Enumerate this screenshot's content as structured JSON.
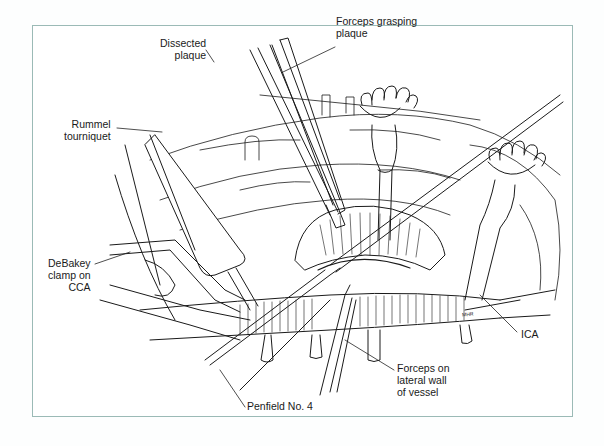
{
  "figure": {
    "border_color": "#9bbab6",
    "line_color": "#1a1a1a"
  },
  "labels": {
    "dissected_plaque": [
      "Dissected",
      "plaque"
    ],
    "forceps_grasping_plaque": [
      "Forceps grasping",
      "plaque"
    ],
    "rummel_tourniquet": [
      "Rummel",
      "tourniquet"
    ],
    "debakey_clamp": [
      "DeBakey",
      "clamp on",
      "CCA"
    ],
    "ica": [
      "ICA"
    ],
    "forceps_lateral_wall": [
      "Forceps on",
      "lateral wall",
      "of vessel"
    ],
    "penfield": [
      "Penfield No. 4"
    ]
  },
  "signature": "MHR"
}
